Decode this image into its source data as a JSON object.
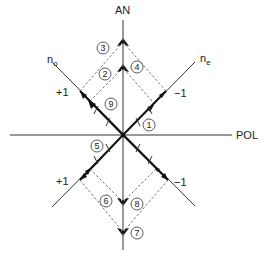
{
  "axes": {
    "vertical_label": "AN",
    "horizontal_label": "POL",
    "diag_left_label": "n",
    "diag_left_sub": "o",
    "diag_right_label": "n",
    "diag_right_sub": "e"
  },
  "ticks": {
    "upper_left": "+1",
    "upper_right": "−1",
    "lower_left": "+1",
    "lower_right": "−1"
  },
  "markers": [
    "1",
    "2",
    "3",
    "4",
    "5",
    "6",
    "7",
    "8",
    "9"
  ],
  "colors": {
    "line": "#333333",
    "dash": "#555555",
    "bg": "#ffffff"
  }
}
